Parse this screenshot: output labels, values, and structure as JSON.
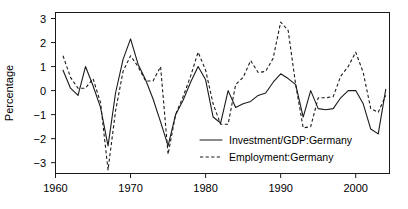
{
  "chart_data": {
    "type": "line",
    "title": "",
    "xlabel": "",
    "ylabel": "Percentage",
    "xlim": [
      1960,
      2004.5
    ],
    "ylim": [
      -3.45,
      3.25
    ],
    "xticks": [
      1960,
      1970,
      1980,
      1990,
      2000
    ],
    "xtick_labels": [
      "1960",
      "1970",
      "1980",
      "1990",
      "2000"
    ],
    "yticks": [
      -3,
      -2,
      -1,
      0,
      1,
      2,
      3
    ],
    "ytick_labels": [
      "−3",
      "−2",
      "−1",
      "0",
      "1",
      "2",
      "3"
    ],
    "grid": false,
    "legend_position": "inside-bottom-right",
    "series": [
      {
        "name": "Investment/GDP:Germany",
        "style": "solid",
        "color": "#1a1a1a",
        "x": [
          1961,
          1962,
          1963,
          1964,
          1965,
          1966,
          1967,
          1968,
          1969,
          1970,
          1971,
          1972,
          1973,
          1974,
          1975,
          1976,
          1977,
          1978,
          1979,
          1980,
          1981,
          1982,
          1983,
          1984,
          1985,
          1986,
          1987,
          1988,
          1989,
          1990,
          1991,
          1992,
          1993,
          1994,
          1995,
          1996,
          1997,
          1998,
          1999,
          2000,
          2001,
          2002,
          2003,
          2004
        ],
        "values": [
          0.85,
          0.1,
          -0.2,
          1.0,
          0.2,
          -0.7,
          -2.3,
          -0.1,
          1.3,
          2.15,
          1.1,
          0.45,
          -0.35,
          -1.3,
          -2.3,
          -1.0,
          -0.4,
          0.35,
          1.0,
          0.45,
          -1.1,
          -1.35,
          0.0,
          -0.7,
          -0.55,
          -0.45,
          -0.2,
          -0.1,
          0.35,
          0.7,
          0.5,
          0.25,
          -1.1,
          0.0,
          -0.75,
          -0.8,
          -0.75,
          -0.3,
          0.0,
          0.0,
          -0.55,
          -1.6,
          -1.8,
          0.05
        ]
      },
      {
        "name": "Employment:Germany",
        "style": "dashed",
        "color": "#1a1a1a",
        "x": [
          1961,
          1962,
          1963,
          1964,
          1965,
          1966,
          1967,
          1968,
          1969,
          1970,
          1971,
          1972,
          1973,
          1974,
          1975,
          1976,
          1977,
          1978,
          1979,
          1980,
          1981,
          1982,
          1983,
          1984,
          1985,
          1986,
          1987,
          1988,
          1989,
          1990,
          1991,
          1992,
          1993,
          1994,
          1995,
          1996,
          1997,
          1998,
          1999,
          2000,
          2001,
          2002,
          2003,
          2004
        ],
        "values": [
          1.45,
          0.55,
          0.1,
          0.1,
          0.5,
          -0.5,
          -3.3,
          -0.85,
          0.8,
          1.45,
          1.0,
          0.4,
          0.4,
          1.0,
          -2.65,
          -1.0,
          -0.25,
          0.6,
          1.6,
          0.85,
          -0.55,
          -1.4,
          -1.4,
          0.25,
          0.55,
          1.25,
          0.75,
          0.8,
          1.35,
          2.85,
          2.5,
          0.25,
          -1.55,
          -1.5,
          -0.3,
          -0.3,
          -0.25,
          0.6,
          1.0,
          1.6,
          0.75,
          -0.75,
          -0.9,
          -0.2
        ]
      }
    ]
  },
  "legend": {
    "items": [
      {
        "label": "Investment/GDP:Germany",
        "style": "solid"
      },
      {
        "label": "Employment:Germany",
        "style": "dashed"
      }
    ]
  },
  "axes": {
    "y_label": "Percentage"
  }
}
